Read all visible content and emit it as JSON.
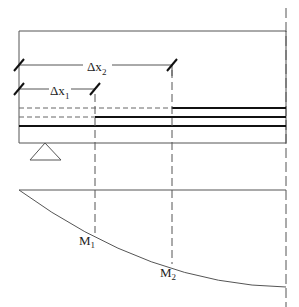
{
  "diagram": {
    "type": "beam bar cut-off / moment diagram",
    "labels": {
      "dx2": "Δx",
      "dx2_sub": "2",
      "dx1": "Δx",
      "dx1_sub": "1",
      "m1": "M",
      "m1_sub": "1",
      "m2": "M",
      "m2_sub": "2"
    },
    "colors": {
      "line": "#444444",
      "thick": "#111111",
      "background": "#ffffff"
    }
  }
}
